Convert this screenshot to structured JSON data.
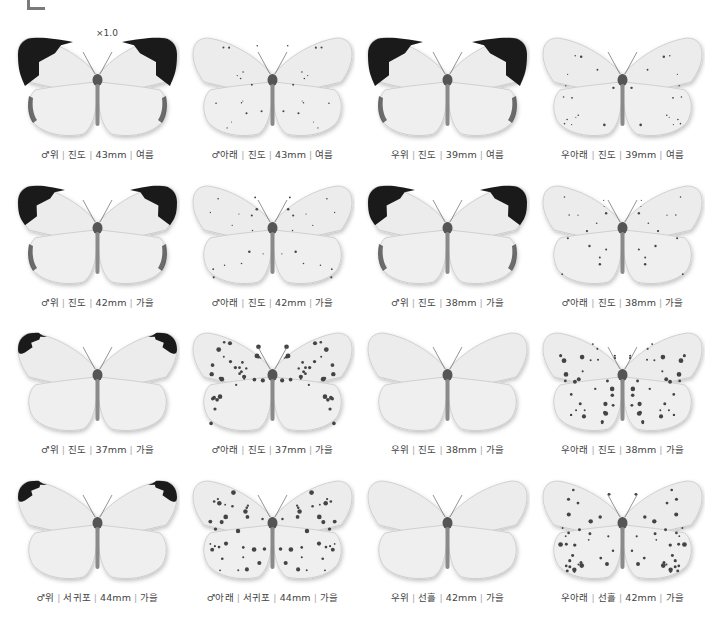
{
  "scale_label": "×1.0",
  "sep": "|",
  "specimens": [
    {
      "sex": "♂",
      "side": "위",
      "locality": "진도",
      "size": "43mm",
      "season": "여름",
      "tip": "large",
      "spots": "none"
    },
    {
      "sex": "♂",
      "side": "아래",
      "locality": "진도",
      "size": "43mm",
      "season": "여름",
      "tip": "none",
      "spots": "light"
    },
    {
      "sex": "우",
      "side": "위",
      "locality": "진도",
      "size": "39mm",
      "season": "여름",
      "tip": "large",
      "spots": "none"
    },
    {
      "sex": "우",
      "side": "아래",
      "locality": "진도",
      "size": "39mm",
      "season": "여름",
      "tip": "none",
      "spots": "light"
    },
    {
      "sex": "♂",
      "side": "위",
      "locality": "진도",
      "size": "42mm",
      "season": "가을",
      "tip": "medium",
      "spots": "none"
    },
    {
      "sex": "♂",
      "side": "아래",
      "locality": "진도",
      "size": "42mm",
      "season": "가을",
      "tip": "none",
      "spots": "light"
    },
    {
      "sex": "♂",
      "side": "위",
      "locality": "진도",
      "size": "38mm",
      "season": "가을",
      "tip": "medium",
      "spots": "none"
    },
    {
      "sex": "♂",
      "side": "아래",
      "locality": "진도",
      "size": "38mm",
      "season": "가을",
      "tip": "none",
      "spots": "light"
    },
    {
      "sex": "♂",
      "side": "위",
      "locality": "진도",
      "size": "37mm",
      "season": "가을",
      "tip": "small",
      "spots": "none"
    },
    {
      "sex": "♂",
      "side": "아래",
      "locality": "진도",
      "size": "37mm",
      "season": "가을",
      "tip": "none",
      "spots": "heavy"
    },
    {
      "sex": "우",
      "side": "위",
      "locality": "진도",
      "size": "38mm",
      "season": "가을",
      "tip": "none",
      "spots": "none"
    },
    {
      "sex": "우",
      "side": "아래",
      "locality": "진도",
      "size": "38mm",
      "season": "가을",
      "tip": "none",
      "spots": "heavy"
    },
    {
      "sex": "♂",
      "side": "위",
      "locality": "서귀포",
      "size": "44mm",
      "season": "가을",
      "tip": "small",
      "spots": "none"
    },
    {
      "sex": "♂",
      "side": "아래",
      "locality": "서귀포",
      "size": "44mm",
      "season": "가을",
      "tip": "none",
      "spots": "heavy"
    },
    {
      "sex": "우",
      "side": "위",
      "locality": "선흘",
      "size": "42mm",
      "season": "가을",
      "tip": "none",
      "spots": "none"
    },
    {
      "sex": "우",
      "side": "아래",
      "locality": "선흘",
      "size": "42mm",
      "season": "가을",
      "tip": "none",
      "spots": "heavy"
    }
  ]
}
